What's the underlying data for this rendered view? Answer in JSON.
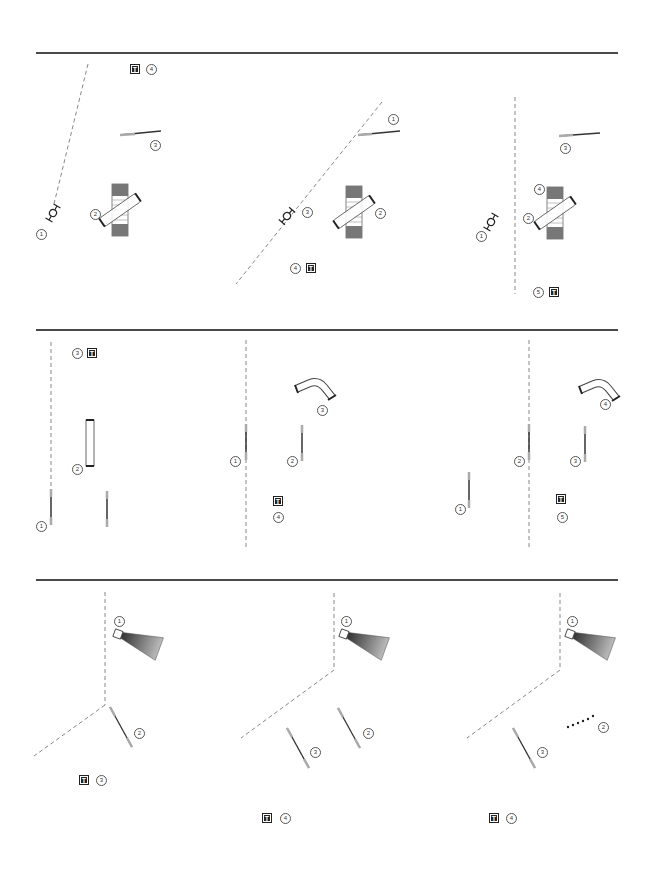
{
  "document": {
    "type": "assembly-instructions",
    "separators_y": [
      52,
      330,
      580
    ],
    "colors": {
      "line": "#4a4a4a",
      "dash": "#888888",
      "part_dark": "#5a5a5a",
      "part_mid": "#9a9a9a"
    }
  },
  "rows": [
    {
      "name": "row-1",
      "steps": [
        {
          "name": "step-1",
          "callouts": [
            "1",
            "2",
            "3",
            "4"
          ],
          "tool_label": "T",
          "tool_callout": "4"
        },
        {
          "name": "step-2",
          "callouts": [
            "1",
            "2",
            "3",
            "4"
          ],
          "tool_label": "T",
          "tool_callout": "4"
        },
        {
          "name": "step-3",
          "callouts": [
            "1",
            "2",
            "3",
            "4",
            "5"
          ],
          "tool_label": "T",
          "tool_callout": "5"
        }
      ]
    },
    {
      "name": "row-2",
      "steps": [
        {
          "name": "step-4",
          "callouts": [
            "1",
            "2",
            "3"
          ],
          "tool_label": "T",
          "tool_callout": "3"
        },
        {
          "name": "step-5",
          "callouts": [
            "1",
            "2",
            "3",
            "4"
          ],
          "tool_label": "T",
          "tool_callout": "4"
        },
        {
          "name": "step-6",
          "callouts": [
            "1",
            "2",
            "3",
            "4",
            "5"
          ],
          "tool_label": "T",
          "tool_callout": "5"
        }
      ]
    },
    {
      "name": "row-3",
      "steps": [
        {
          "name": "step-7",
          "callouts": [
            "1",
            "2",
            "3"
          ],
          "tool_label": "T",
          "tool_callout": "3"
        },
        {
          "name": "step-8",
          "callouts": [
            "1",
            "2",
            "3",
            "4"
          ],
          "tool_label": "T",
          "tool_callout": "4"
        },
        {
          "name": "step-9",
          "callouts": [
            "1",
            "2",
            "3",
            "4"
          ],
          "tool_label": "T",
          "tool_callout": "4"
        }
      ]
    }
  ],
  "labels": {
    "r1s1": {
      "c1": "1",
      "c2": "2",
      "c3": "3",
      "c4": "4",
      "t": "T"
    },
    "r1s2": {
      "c1": "1",
      "c2": "2",
      "c3": "3",
      "c4": "4",
      "t": "T"
    },
    "r1s3": {
      "c1": "1",
      "c2": "2",
      "c3": "3",
      "c4": "4",
      "c5": "5",
      "t": "T"
    },
    "r2s1": {
      "c1": "1",
      "c2": "2",
      "c3": "3",
      "t": "T"
    },
    "r2s2": {
      "c1": "1",
      "c2": "2",
      "c3": "3",
      "c4": "4",
      "t": "T"
    },
    "r2s3": {
      "c1": "1",
      "c2": "2",
      "c3": "3",
      "c4": "4",
      "c5": "5",
      "t": "T"
    },
    "r3s1": {
      "c1": "1",
      "c2": "2",
      "c3": "3",
      "t": "T"
    },
    "r3s2": {
      "c1": "1",
      "c2": "2",
      "c3": "3",
      "c4": "4",
      "t": "T"
    },
    "r3s3": {
      "c1": "1",
      "c2": "2",
      "c3": "3",
      "c4": "4",
      "t": "T"
    }
  }
}
